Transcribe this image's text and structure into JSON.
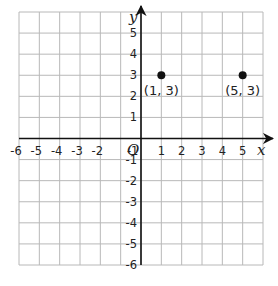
{
  "grid": {
    "x_min": -6,
    "x_max": 6,
    "y_min": -6,
    "y_max": 6,
    "left": 19,
    "top": 12,
    "right": 263,
    "bottom": 265,
    "grid_color": "#b8b8b8",
    "axis_color": "#111111"
  },
  "axes": {
    "x_label": "x",
    "y_label": "y",
    "origin_label": "O"
  },
  "x_ticks": [
    "-6",
    "-5",
    "-4",
    "-3",
    "-2",
    "-1",
    "1",
    "2",
    "3",
    "4",
    "5"
  ],
  "y_ticks": [
    "5",
    "4",
    "3",
    "2",
    "1",
    "-1",
    "-2",
    "-3",
    "-4",
    "-5",
    "-6"
  ],
  "points": [
    {
      "x": 1,
      "y": 3,
      "label": "(1, 3)"
    },
    {
      "x": 5,
      "y": 3,
      "label": "(5, 3)"
    }
  ],
  "chart_data": {
    "type": "scatter",
    "title": "",
    "xlabel": "x",
    "ylabel": "y",
    "xlim": [
      -6,
      6
    ],
    "ylim": [
      -6,
      6
    ],
    "grid": true,
    "x_tick_labels": [
      "-6",
      "-5",
      "-4",
      "-3",
      "-2",
      "-1",
      "1",
      "2",
      "3",
      "4",
      "5"
    ],
    "y_tick_labels": [
      "-6",
      "-5",
      "-4",
      "-3",
      "-2",
      "-1",
      "1",
      "2",
      "3",
      "4",
      "5"
    ],
    "series": [
      {
        "name": "points",
        "x": [
          1,
          5
        ],
        "y": [
          3,
          3
        ],
        "labels": [
          "(1, 3)",
          "(5, 3)"
        ]
      }
    ]
  }
}
